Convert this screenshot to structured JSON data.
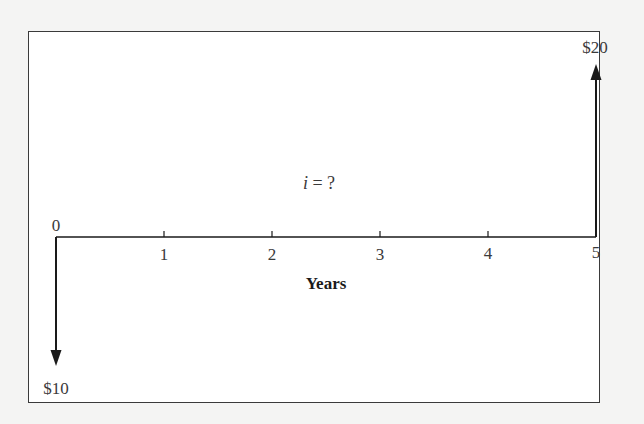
{
  "diagram": {
    "type": "cash-flow-diagram",
    "interest_rate": {
      "variable": "i",
      "operator": " = ",
      "value": "?"
    },
    "axis": {
      "title": "Years",
      "ticks": [
        "0",
        "1",
        "2",
        "3",
        "4",
        "5"
      ]
    },
    "cash_flows": [
      {
        "period": "0",
        "direction": "out",
        "label": "$10",
        "amount": 10
      },
      {
        "period": "5",
        "direction": "in",
        "label": "$20",
        "amount": 20
      }
    ],
    "colors": {
      "line": "#1a1a1a",
      "text": "#3a3a3a",
      "background": "#ffffff",
      "page": "#f4f4f3"
    }
  }
}
